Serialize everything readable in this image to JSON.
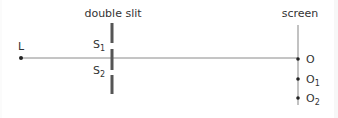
{
  "diagram": {
    "title_slit": "double slit",
    "title_screen": "screen",
    "source_label": "L",
    "slit_labels": [
      {
        "base": "S",
        "sub": "1"
      },
      {
        "base": "S",
        "sub": "2"
      }
    ],
    "screen_points": [
      {
        "base": "O",
        "sub": ""
      },
      {
        "base": "O",
        "sub": "1"
      },
      {
        "base": "O",
        "sub": "2"
      }
    ],
    "colors": {
      "line": "#777777",
      "barrier": "#555555",
      "dot": "#222222",
      "text": "#333333"
    }
  }
}
